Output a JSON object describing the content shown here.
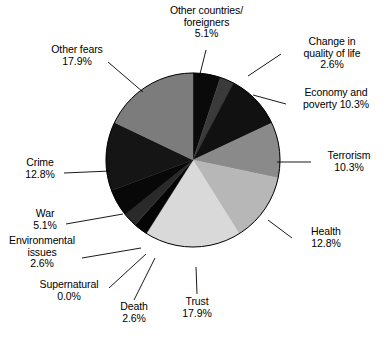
{
  "chart_data": {
    "type": "pie",
    "title": "",
    "subtitle": "",
    "xlabel": "",
    "ylabel": "",
    "legend_position": "none",
    "grid": false,
    "value_unit": "%",
    "start_angle_deg": 0,
    "direction": "clockwise",
    "categories": [
      "Other countries/ foreigners",
      "Change in quality of life",
      "Economy and poverty",
      "Terrorism",
      "Health",
      "Trust",
      "Death",
      "Supernatural",
      "Environmental issues",
      "War",
      "Crime",
      "Other fears"
    ],
    "values": [
      5.1,
      2.6,
      10.3,
      10.3,
      12.8,
      17.9,
      2.6,
      0.0,
      2.6,
      5.1,
      12.8,
      17.9
    ],
    "colors": [
      "#0a0a0a",
      "#3a3a3a",
      "#111111",
      "#8a8a8a",
      "#b7b7b7",
      "#d9d9d9",
      "#050505",
      "#ffffff",
      "#2a2a2a",
      "#080808",
      "#151515",
      "#7c7c7c"
    ],
    "slices": [
      {
        "label": "Other countries/ foreigners",
        "value": 5.1,
        "value_text": "5.1%",
        "color": "#0a0a0a"
      },
      {
        "label": "Change in quality of life",
        "value": 2.6,
        "value_text": "2.6%",
        "color": "#3a3a3a"
      },
      {
        "label": "Economy and poverty",
        "value": 10.3,
        "value_text": "10.3%",
        "color": "#111111"
      },
      {
        "label": "Terrorism",
        "value": 10.3,
        "value_text": "10.3%",
        "color": "#8a8a8a"
      },
      {
        "label": "Health",
        "value": 12.8,
        "value_text": "12.8%",
        "color": "#b7b7b7"
      },
      {
        "label": "Trust",
        "value": 17.9,
        "value_text": "17.9%",
        "color": "#d9d9d9"
      },
      {
        "label": "Death",
        "value": 2.6,
        "value_text": "2.6%",
        "color": "#050505"
      },
      {
        "label": "Supernatural",
        "value": 0.0,
        "value_text": "0.0%",
        "color": "#ffffff"
      },
      {
        "label": "Environmental issues",
        "value": 2.6,
        "value_text": "2.6%",
        "color": "#2a2a2a"
      },
      {
        "label": "War",
        "value": 5.1,
        "value_text": "5.1%",
        "color": "#080808"
      },
      {
        "label": "Crime",
        "value": 12.8,
        "value_text": "12.8%",
        "color": "#151515"
      },
      {
        "label": "Other fears",
        "value": 17.9,
        "value_text": "17.9%",
        "color": "#7c7c7c"
      }
    ]
  },
  "labels": {
    "other_countries": "Other countries/\nforeigners\n5.1%",
    "quality_of_life": "Change in\nquality of life\n2.6%",
    "economy": "Economy and\npoverty 10.3%",
    "terrorism": "Terrorism\n10.3%",
    "health": "Health\n12.8%",
    "trust": "Trust\n17.9%",
    "death": "Death\n2.6%",
    "supernatural": "Supernatural\n0.0%",
    "environmental": "Environmental\nissues\n2.6%",
    "war": "War\n5.1%",
    "crime": "Crime\n12.8%",
    "other_fears": "Other fears\n17.9%"
  },
  "geometry": {
    "center_x": 193,
    "center_y": 160,
    "radius": 87,
    "outline_color": "#000000"
  }
}
